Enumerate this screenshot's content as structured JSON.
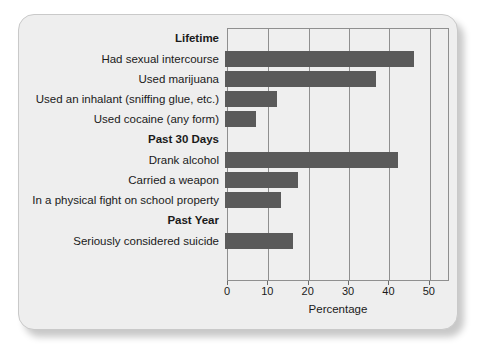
{
  "chart_data": {
    "type": "bar",
    "orientation": "horizontal",
    "title": "",
    "xlabel": "Percentage",
    "ylabel": "",
    "xlim": [
      0,
      55
    ],
    "xticks": [
      0,
      10,
      20,
      30,
      40,
      50
    ],
    "xticklabels": [
      "0",
      "10",
      "20",
      "30",
      "40",
      "50"
    ],
    "grid": true,
    "grid_axis": "x",
    "legend": false,
    "bar_color": "#5a5a5a",
    "background_color": "#efefef",
    "groups": [
      {
        "name": "Lifetime",
        "items": [
          {
            "category": "Had sexual intercourse",
            "value": 46.8
          },
          {
            "category": "Used marijuana",
            "value": 37.4
          },
          {
            "category": "Used an inhalant (sniffing glue, etc.)",
            "value": 12.8
          },
          {
            "category": "Used cocaine (any form)",
            "value": 7.6
          }
        ]
      },
      {
        "name": "Past 30 Days",
        "items": [
          {
            "category": "Drank alcohol",
            "value": 42.9
          },
          {
            "category": "Carried a weapon",
            "value": 18.0
          },
          {
            "category": "In a physical fight on school property",
            "value": 13.8
          }
        ]
      },
      {
        "name": "Past Year",
        "items": [
          {
            "category": "Seriously considered suicide",
            "value": 16.9
          }
        ]
      }
    ],
    "categories": [
      "Had sexual intercourse",
      "Used marijuana",
      "Used an inhalant (sniffing glue, etc.)",
      "Used cocaine (any form)",
      "Drank alcohol",
      "Carried a weapon",
      "In a physical fight on school property",
      "Seriously considered suicide"
    ],
    "values": [
      46.8,
      37.4,
      12.8,
      7.6,
      42.9,
      18.0,
      13.8,
      16.9
    ]
  }
}
